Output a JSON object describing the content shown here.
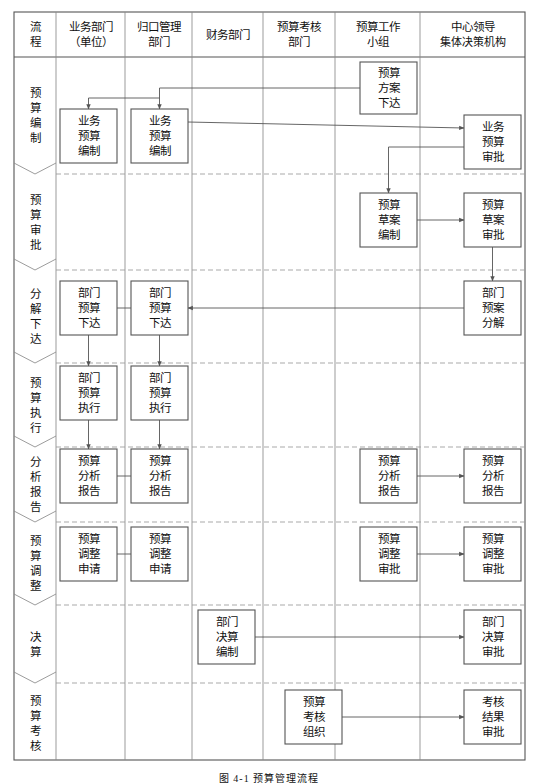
{
  "figure": {
    "caption": "图 4-1  预算管理流程",
    "type": "swimlane-flowchart"
  },
  "columns": [
    {
      "id": "process",
      "label": "流程",
      "label_lines": [
        "流",
        "程"
      ],
      "x": 14,
      "w": 42
    },
    {
      "id": "business_dept",
      "label": "业务部门（单位）",
      "label_lines": [
        "业务部门",
        "（单位）"
      ],
      "x": 56,
      "w": 69
    },
    {
      "id": "central_mgmt_dept",
      "label": "归口管理部门",
      "label_lines": [
        "归口管理",
        "部门"
      ],
      "x": 125,
      "w": 67
    },
    {
      "id": "finance_dept",
      "label": "财务部门",
      "label_lines": [
        "财务部门"
      ],
      "x": 192,
      "w": 71
    },
    {
      "id": "budget_review_dept",
      "label": "预算考核部门",
      "label_lines": [
        "预算考核",
        "部门"
      ],
      "x": 263,
      "w": 72
    },
    {
      "id": "budget_work_group",
      "label": "预算工作小组",
      "label_lines": [
        "预算工作",
        "小组"
      ],
      "x": 335,
      "w": 85
    },
    {
      "id": "leadership_body",
      "label": "中心领导集体决策机构",
      "label_lines": [
        "中心领导",
        "集体决策机构"
      ],
      "x": 420,
      "w": 105
    }
  ],
  "stages": [
    {
      "id": "compile",
      "label": "预算编制",
      "chars": [
        "预",
        "算",
        "编",
        "制"
      ],
      "y": 57,
      "h": 117
    },
    {
      "id": "approve",
      "label": "预算审批",
      "chars": [
        "预",
        "算",
        "审",
        "批"
      ],
      "y": 174,
      "h": 96
    },
    {
      "id": "breakdown",
      "label": "分解下达",
      "chars": [
        "分",
        "解",
        "下",
        "达"
      ],
      "y": 270,
      "h": 93
    },
    {
      "id": "execute",
      "label": "预算执行",
      "chars": [
        "预",
        "算",
        "执",
        "行"
      ],
      "y": 363,
      "h": 84
    },
    {
      "id": "analysis",
      "label": "分析报告",
      "chars": [
        "分",
        "析",
        "报",
        "告"
      ],
      "y": 447,
      "h": 75
    },
    {
      "id": "adjust",
      "label": "预算调整",
      "chars": [
        "预",
        "算",
        "调",
        "整"
      ],
      "y": 522,
      "h": 83
    },
    {
      "id": "settlement",
      "label": "决算",
      "chars": [
        "决",
        "算"
      ],
      "y": 605,
      "h": 78
    },
    {
      "id": "assessment",
      "label": "预算考核",
      "chars": [
        "预",
        "算",
        "考",
        "核"
      ],
      "y": 683,
      "h": 80
    }
  ],
  "nodes": [
    {
      "id": "n1",
      "stage": "compile",
      "column": "budget_work_group",
      "label": "预算方案下达",
      "lines": [
        "预算",
        "方案",
        "下达"
      ],
      "x": 360,
      "y": 62,
      "w": 57,
      "h": 52
    },
    {
      "id": "n2",
      "stage": "compile",
      "column": "business_dept",
      "label": "业务预算编制",
      "lines": [
        "业务",
        "预算",
        "编制"
      ],
      "x": 60,
      "y": 109,
      "w": 57,
      "h": 54
    },
    {
      "id": "n3",
      "stage": "compile",
      "column": "central_mgmt_dept",
      "label": "业务预算编制",
      "lines": [
        "业务",
        "预算",
        "编制"
      ],
      "x": 131,
      "y": 109,
      "w": 57,
      "h": 54
    },
    {
      "id": "n4",
      "stage": "compile",
      "column": "leadership_body",
      "label": "业务预算审批",
      "lines": [
        "业务",
        "预算",
        "审批"
      ],
      "x": 464,
      "y": 115,
      "w": 57,
      "h": 54
    },
    {
      "id": "n5",
      "stage": "approve",
      "column": "budget_work_group",
      "label": "预算草案编制",
      "lines": [
        "预算",
        "草案",
        "编制"
      ],
      "x": 360,
      "y": 193,
      "w": 57,
      "h": 54
    },
    {
      "id": "n6",
      "stage": "approve",
      "column": "leadership_body",
      "label": "预算草案审批",
      "lines": [
        "预算",
        "草案",
        "审批"
      ],
      "x": 464,
      "y": 193,
      "w": 57,
      "h": 54
    },
    {
      "id": "n7",
      "stage": "breakdown",
      "column": "leadership_body",
      "label": "部门预案分解",
      "lines": [
        "部门",
        "预案",
        "分解"
      ],
      "x": 464,
      "y": 281,
      "w": 57,
      "h": 54
    },
    {
      "id": "n8",
      "stage": "breakdown",
      "column": "business_dept",
      "label": "部门预算下达",
      "lines": [
        "部门",
        "预算",
        "下达"
      ],
      "x": 60,
      "y": 281,
      "w": 57,
      "h": 54
    },
    {
      "id": "n9",
      "stage": "breakdown",
      "column": "central_mgmt_dept",
      "label": "部门预算下达",
      "lines": [
        "部门",
        "预算",
        "下达"
      ],
      "x": 131,
      "y": 281,
      "w": 57,
      "h": 54
    },
    {
      "id": "n10",
      "stage": "execute",
      "column": "business_dept",
      "label": "部门预算执行",
      "lines": [
        "部门",
        "预算",
        "执行"
      ],
      "x": 60,
      "y": 366,
      "w": 57,
      "h": 54
    },
    {
      "id": "n11",
      "stage": "execute",
      "column": "central_mgmt_dept",
      "label": "部门预算执行",
      "lines": [
        "部门",
        "预算",
        "执行"
      ],
      "x": 131,
      "y": 366,
      "w": 57,
      "h": 54
    },
    {
      "id": "n12",
      "stage": "analysis",
      "column": "business_dept",
      "label": "预算分析报告",
      "lines": [
        "预算",
        "分析",
        "报告"
      ],
      "x": 60,
      "y": 449,
      "w": 57,
      "h": 54
    },
    {
      "id": "n13",
      "stage": "analysis",
      "column": "central_mgmt_dept",
      "label": "预算分析报告",
      "lines": [
        "预算",
        "分析",
        "报告"
      ],
      "x": 131,
      "y": 449,
      "w": 57,
      "h": 54
    },
    {
      "id": "n14",
      "stage": "analysis",
      "column": "budget_work_group",
      "label": "预算分析报告",
      "lines": [
        "预算",
        "分析",
        "报告"
      ],
      "x": 360,
      "y": 449,
      "w": 57,
      "h": 54
    },
    {
      "id": "n15",
      "stage": "analysis",
      "column": "leadership_body",
      "label": "预算分析报告",
      "lines": [
        "预算",
        "分析",
        "报告"
      ],
      "x": 464,
      "y": 449,
      "w": 57,
      "h": 54
    },
    {
      "id": "n16",
      "stage": "adjust",
      "column": "business_dept",
      "label": "预算调整申请",
      "lines": [
        "预算",
        "调整",
        "申请"
      ],
      "x": 60,
      "y": 527,
      "w": 57,
      "h": 54
    },
    {
      "id": "n17",
      "stage": "adjust",
      "column": "central_mgmt_dept",
      "label": "预算调整申请",
      "lines": [
        "预算",
        "调整",
        "申请"
      ],
      "x": 131,
      "y": 527,
      "w": 57,
      "h": 54
    },
    {
      "id": "n18",
      "stage": "adjust",
      "column": "budget_work_group",
      "label": "预算调整审批",
      "lines": [
        "预算",
        "调整",
        "审批"
      ],
      "x": 360,
      "y": 527,
      "w": 57,
      "h": 54
    },
    {
      "id": "n19",
      "stage": "adjust",
      "column": "leadership_body",
      "label": "预算调整审批",
      "lines": [
        "预算",
        "调整",
        "审批"
      ],
      "x": 464,
      "y": 527,
      "w": 57,
      "h": 54
    },
    {
      "id": "n20",
      "stage": "settlement",
      "column": "finance_dept",
      "label": "部门决算编制",
      "lines": [
        "部门",
        "决算",
        "编制"
      ],
      "x": 198,
      "y": 610,
      "w": 57,
      "h": 54
    },
    {
      "id": "n21",
      "stage": "settlement",
      "column": "leadership_body",
      "label": "部门决算审批",
      "lines": [
        "部门",
        "决算",
        "审批"
      ],
      "x": 464,
      "y": 610,
      "w": 57,
      "h": 54
    },
    {
      "id": "n22",
      "stage": "assessment",
      "column": "budget_review_dept",
      "label": "预算考核组织",
      "lines": [
        "预算",
        "考核",
        "组织"
      ],
      "x": 285,
      "y": 690,
      "w": 57,
      "h": 54
    },
    {
      "id": "n23",
      "stage": "assessment",
      "column": "leadership_body",
      "label": "考核结果审批",
      "lines": [
        "考核",
        "结果",
        "审批"
      ],
      "x": 464,
      "y": 690,
      "w": 57,
      "h": 54
    }
  ],
  "edges": [
    {
      "id": "e1",
      "from": "n1",
      "to": "n2",
      "kind": "fanout-down"
    },
    {
      "id": "e2",
      "from": "n1",
      "to": "n3",
      "kind": "fanout-down"
    },
    {
      "id": "e3",
      "from": "n3",
      "to": "n4",
      "kind": "horizontal-right"
    },
    {
      "id": "e4",
      "from": "n4",
      "to": "n5",
      "kind": "down-left"
    },
    {
      "id": "e5",
      "from": "n5",
      "to": "n6",
      "kind": "horizontal-right"
    },
    {
      "id": "e6",
      "from": "n6",
      "to": "n7",
      "kind": "vertical-down"
    },
    {
      "id": "e7",
      "from": "n7",
      "to": "n9",
      "kind": "horizontal-left"
    },
    {
      "id": "e8",
      "from": "n9",
      "to": "n8",
      "kind": "horizontal-left"
    },
    {
      "id": "e9",
      "from": "n8",
      "to": "n10",
      "kind": "vertical-down"
    },
    {
      "id": "e10",
      "from": "n9",
      "to": "n11",
      "kind": "vertical-down"
    },
    {
      "id": "e11",
      "from": "n10",
      "to": "n12",
      "kind": "vertical-down"
    },
    {
      "id": "e12",
      "from": "n11",
      "to": "n13",
      "kind": "vertical-down"
    },
    {
      "id": "e13",
      "from": "n12",
      "to": "n13",
      "kind": "horizontal-right"
    },
    {
      "id": "e14",
      "from": "n13",
      "to": "n14",
      "kind": "horizontal-right"
    },
    {
      "id": "e15",
      "from": "n14",
      "to": "n15",
      "kind": "horizontal-right"
    },
    {
      "id": "e16",
      "from": "n16",
      "to": "n17",
      "kind": "horizontal-right"
    },
    {
      "id": "e17",
      "from": "n17",
      "to": "n18",
      "kind": "horizontal-right"
    },
    {
      "id": "e18",
      "from": "n18",
      "to": "n19",
      "kind": "horizontal-right"
    },
    {
      "id": "e19",
      "from": "n20",
      "to": "n21",
      "kind": "horizontal-right"
    },
    {
      "id": "e20",
      "from": "n22",
      "to": "n23",
      "kind": "horizontal-right"
    }
  ],
  "style": {
    "border_color": "#555555",
    "grid_color": "#8a8a8a",
    "divider_color": "#9a9a9a",
    "arrow_color": "#555555",
    "box_fill": "#ffffff",
    "page_bg": "#ffffff"
  }
}
